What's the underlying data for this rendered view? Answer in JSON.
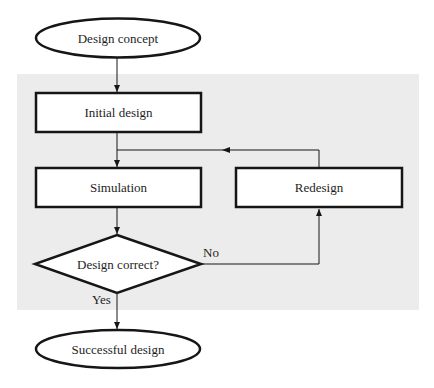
{
  "diagram": {
    "type": "flowchart",
    "colors": {
      "background": "#ffffff",
      "region": "#ececec",
      "stroke": "#161616",
      "node_fill": "#ffffff",
      "text": "#1e1e1e"
    },
    "nodes": {
      "start": {
        "shape": "ellipse",
        "label": "Design concept"
      },
      "initial": {
        "shape": "rectangle",
        "label": "Initial design"
      },
      "simulation": {
        "shape": "rectangle",
        "label": "Simulation"
      },
      "redesign": {
        "shape": "rectangle",
        "label": "Redesign"
      },
      "decision": {
        "shape": "diamond",
        "label": "Design correct?"
      },
      "end": {
        "shape": "ellipse",
        "label": "Successful design"
      }
    },
    "edges": {
      "yes_label": "Yes",
      "no_label": "No"
    },
    "edge_list": [
      {
        "from": "start",
        "to": "initial",
        "label": ""
      },
      {
        "from": "initial",
        "to": "simulation",
        "label": ""
      },
      {
        "from": "simulation",
        "to": "decision",
        "label": ""
      },
      {
        "from": "decision",
        "to": "redesign",
        "label": "No"
      },
      {
        "from": "redesign",
        "to": "simulation",
        "label": ""
      },
      {
        "from": "decision",
        "to": "end",
        "label": "Yes"
      }
    ]
  }
}
